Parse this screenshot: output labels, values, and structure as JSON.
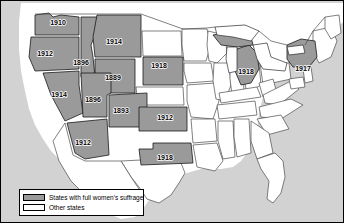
{
  "figure": {
    "name": "women-suffrage-map",
    "region": "United States"
  },
  "colors": {
    "suffrage_fill": "#9a9a9a",
    "other_fill": "#ffffff",
    "ocean_fill": "#d2d2d2",
    "border": "#000000",
    "state_line": "#4a4a4a"
  },
  "legend": {
    "items": [
      {
        "swatch": "suffrage",
        "label": "States with full women's suffrage"
      },
      {
        "swatch": "other",
        "label": "Other states"
      }
    ]
  },
  "map_labels": [
    {
      "state": "Washington",
      "year": "1910",
      "x": 57,
      "y": 22
    },
    {
      "state": "Oregon",
      "year": "1912",
      "x": 44,
      "y": 53
    },
    {
      "state": "Idaho",
      "year": "1896",
      "x": 80,
      "y": 62
    },
    {
      "state": "Montana",
      "year": "1914",
      "x": 113,
      "y": 41
    },
    {
      "state": "South Dakota",
      "year": "1918",
      "x": 158,
      "y": 65
    },
    {
      "state": "Wyoming",
      "year": "1889",
      "x": 112,
      "y": 77
    },
    {
      "state": "Nevada",
      "year": "1914",
      "x": 58,
      "y": 94
    },
    {
      "state": "Utah",
      "year": "1896",
      "x": 92,
      "y": 99
    },
    {
      "state": "Colorado",
      "year": "1893",
      "x": 120,
      "y": 110
    },
    {
      "state": "Kansas",
      "year": "1912",
      "x": 164,
      "y": 117
    },
    {
      "state": "Arizona",
      "year": "1912",
      "x": 82,
      "y": 142
    },
    {
      "state": "Oklahoma",
      "year": "1918",
      "x": 164,
      "y": 157
    },
    {
      "state": "Michigan",
      "year": "1918",
      "x": 245,
      "y": 71
    },
    {
      "state": "New York",
      "year": "1917",
      "x": 302,
      "y": 68
    }
  ],
  "suffrage_states": [
    "Washington",
    "Oregon",
    "Idaho",
    "Montana",
    "Nevada",
    "Utah",
    "Wyoming",
    "Colorado",
    "Arizona",
    "Kansas",
    "South Dakota",
    "Oklahoma",
    "Michigan",
    "New York"
  ]
}
